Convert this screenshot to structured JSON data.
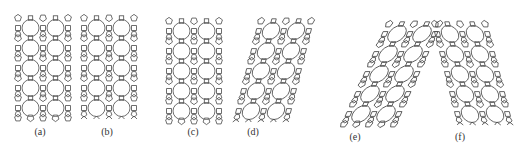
{
  "figure": {
    "stroke_color": "#4a4a4a",
    "background": "#ffffff",
    "panels": [
      {
        "id": "a",
        "label": "(a)",
        "shear": 0,
        "boundary": "pentagon-edge",
        "x": 14,
        "y": 14,
        "label_x": 40,
        "label_y": 126
      },
      {
        "id": "b",
        "label": "(b)",
        "shear": 0,
        "boundary": "cut-edge",
        "x": 80,
        "y": 14,
        "label_x": 107,
        "label_y": 126
      },
      {
        "id": "c",
        "label": "(c)",
        "shear": 0,
        "boundary": "pentagon-edge",
        "x": 165,
        "y": 17,
        "label_x": 193,
        "label_y": 126
      },
      {
        "id": "d",
        "label": "(d)",
        "shear": -0.25,
        "boundary": "cut-edge",
        "x": 232,
        "y": 17,
        "label_x": 253,
        "label_y": 126
      },
      {
        "id": "e",
        "label": "(e)",
        "shear": -0.45,
        "boundary": "pentagon-edge",
        "x": 340,
        "y": 20,
        "label_x": 355,
        "label_y": 131
      },
      {
        "id": "f",
        "label": "(f)",
        "shear": 0.25,
        "boundary": "cut-edge",
        "x": 430,
        "y": 20,
        "label_x": 460,
        "label_y": 131
      }
    ],
    "lattice": {
      "columns": 2,
      "rows": 5,
      "cell_w": 25,
      "cell_h": 20,
      "circle_r": 8.5
    }
  }
}
